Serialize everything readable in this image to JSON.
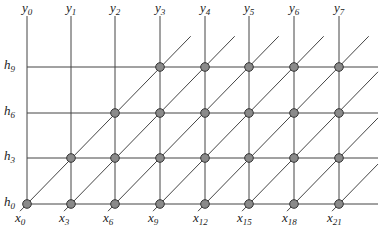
{
  "diagram": {
    "colors": {
      "line": "#444444",
      "node_fill": "#8a8a8a",
      "node_stroke": "#333333",
      "text": "#222222"
    },
    "columns": [
      {
        "label": "y",
        "sub": "0",
        "x": 27
      },
      {
        "label": "y",
        "sub": "1",
        "x": 71
      },
      {
        "label": "y",
        "sub": "2",
        "x": 115
      },
      {
        "label": "y",
        "sub": "3",
        "x": 160
      },
      {
        "label": "y",
        "sub": "4",
        "x": 205
      },
      {
        "label": "y",
        "sub": "5",
        "x": 249
      },
      {
        "label": "y",
        "sub": "6",
        "x": 294
      },
      {
        "label": "y",
        "sub": "7",
        "x": 339
      }
    ],
    "rows": [
      {
        "label": "h",
        "sub": "9",
        "y": 67
      },
      {
        "label": "h",
        "sub": "6",
        "y": 113
      },
      {
        "label": "h",
        "sub": "3",
        "y": 158
      },
      {
        "label": "h",
        "sub": "0",
        "y": 204
      }
    ],
    "bottom_labels": [
      {
        "label": "x",
        "sub": "0"
      },
      {
        "label": "x",
        "sub": "3"
      },
      {
        "label": "x",
        "sub": "6"
      },
      {
        "label": "x",
        "sub": "9"
      },
      {
        "label": "x",
        "sub": "12"
      },
      {
        "label": "x",
        "sub": "15"
      },
      {
        "label": "x",
        "sub": "18"
      },
      {
        "label": "x",
        "sub": "21"
      }
    ],
    "grid": {
      "top": 16,
      "right": 378,
      "left": 27,
      "bottom": 204
    }
  }
}
